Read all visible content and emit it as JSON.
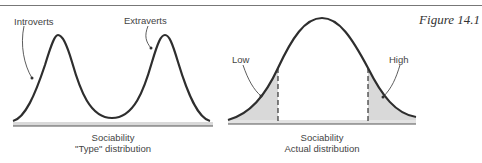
{
  "figure": {
    "label": "Figure 14.1",
    "left_panel": {
      "labels": [
        "Introverts",
        "Extraverts"
      ],
      "caption_line1": "Sociability",
      "caption_line2": "\"Type\" distribution",
      "type": "bimodal"
    },
    "right_panel": {
      "labels": [
        "Low",
        "High"
      ],
      "caption_line1": "Sociability",
      "caption_line2": "Actual distribution",
      "type": "normal with shaded tails"
    }
  },
  "colors": {
    "curve": "#2e2e2e",
    "shade": "#d9d9d9",
    "axis": "#555555"
  }
}
